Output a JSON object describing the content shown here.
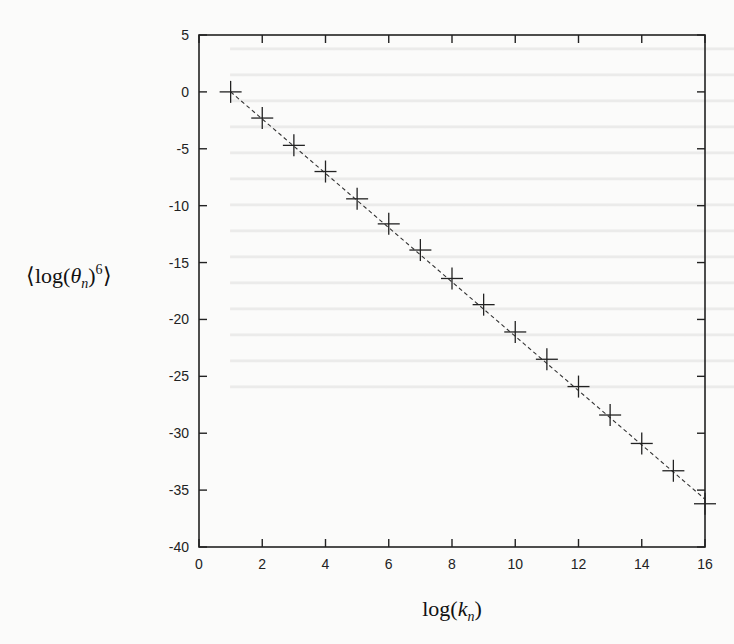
{
  "chart_data": {
    "type": "scatter",
    "title": "",
    "xlabel": "log(k_n)",
    "ylabel": "⟨log(θ_n)^6⟩",
    "xlim": [
      0,
      16
    ],
    "ylim": [
      -40,
      5
    ],
    "xticks": [
      0,
      2,
      4,
      6,
      8,
      10,
      12,
      14,
      16
    ],
    "yticks": [
      5,
      0,
      -5,
      -10,
      -15,
      -20,
      -25,
      -30,
      -35,
      -40
    ],
    "grid": false,
    "legend": null,
    "marker": "+",
    "series": [
      {
        "name": "data",
        "style": "markers",
        "x": [
          1,
          2,
          3,
          4,
          5,
          6,
          7,
          8,
          9,
          10,
          11,
          12,
          13,
          14,
          15,
          16
        ],
        "y": [
          0.0,
          -2.3,
          -4.7,
          -7.0,
          -9.4,
          -11.6,
          -13.9,
          -16.4,
          -18.7,
          -21.1,
          -23.5,
          -25.9,
          -28.4,
          -30.9,
          -33.3,
          -36.2
        ]
      },
      {
        "name": "fit",
        "style": "dashed-line",
        "x": [
          1,
          16
        ],
        "y": [
          0.0,
          -35.8
        ]
      }
    ]
  },
  "axes": {
    "xlabel_main": "log(",
    "xlabel_var": "k",
    "xlabel_sub": "n",
    "xlabel_close": ")",
    "ylabel_open": "⟨log(",
    "ylabel_var": "θ",
    "ylabel_sub": "n",
    "ylabel_close": ")",
    "ylabel_sup": "6",
    "ylabel_end": "⟩"
  }
}
